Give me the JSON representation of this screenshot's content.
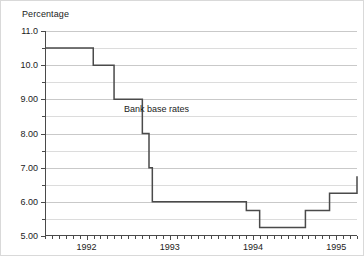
{
  "chart_data": {
    "type": "line",
    "line_style": "step-post",
    "title": "",
    "xlabel": "",
    "ylabel": "Percentage",
    "ylim": [
      5.0,
      11.0
    ],
    "xlim": [
      1991.5,
      1995.25
    ],
    "grid": true,
    "legend_position": "none",
    "y_major_ticks": [
      5.0,
      6.0,
      7.0,
      8.0,
      9.0,
      10.0,
      11.0
    ],
    "y_major_tick_labels": [
      "5.00",
      "6.00",
      "7.00",
      "8.00",
      "9.00",
      "10.0",
      "11.0"
    ],
    "y_minor_ticks": [
      5.5,
      6.5,
      7.5,
      8.5,
      9.5,
      10.5
    ],
    "x_major_ticks": [
      1992,
      1993,
      1994,
      1995
    ],
    "x_major_tick_labels": [
      "1992",
      "1993",
      "1994",
      "1995"
    ],
    "annotations": [
      {
        "text": "Bank base rates",
        "x": 1992.45,
        "y": 8.85
      }
    ],
    "series": [
      {
        "name": "Bank base rates",
        "color": "#4a4a4a",
        "x": [
          1991.5,
          1992.08,
          1992.33,
          1992.67,
          1992.75,
          1992.79,
          1993.0,
          1993.92,
          1994.08,
          1994.63,
          1994.92,
          1995.25
        ],
        "values": [
          10.5,
          10.0,
          9.0,
          8.0,
          7.0,
          6.0,
          6.0,
          5.75,
          5.25,
          5.75,
          6.25,
          6.75
        ]
      }
    ]
  },
  "axis": {
    "y_title": "Percentage"
  }
}
